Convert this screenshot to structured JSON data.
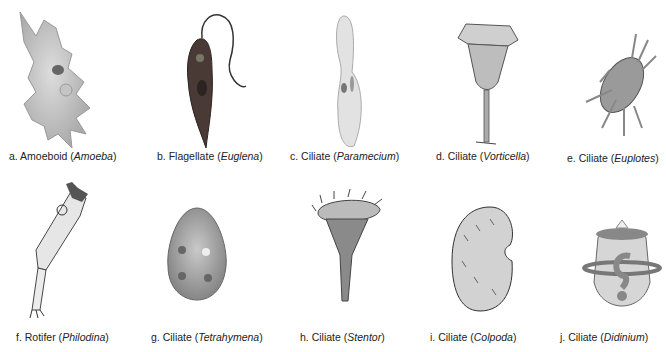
{
  "figure": {
    "panels": [
      {
        "letter": "a.",
        "type": "Amoeboid",
        "genus": "Amoeba",
        "icon": "amoeba-illustration"
      },
      {
        "letter": "b.",
        "type": "Flagellate",
        "genus": "Euglena",
        "icon": "euglena-illustration"
      },
      {
        "letter": "c.",
        "type": "Ciliate",
        "genus": "Paramecium",
        "icon": "paramecium-illustration"
      },
      {
        "letter": "d.",
        "type": "Ciliate",
        "genus": "Vorticella",
        "icon": "vorticella-illustration"
      },
      {
        "letter": "e.",
        "type": "Ciliate",
        "genus": "Euplotes",
        "icon": "euplotes-illustration"
      },
      {
        "letter": "f.",
        "type": "Rotifer",
        "genus": "Philodina",
        "icon": "philodina-illustration"
      },
      {
        "letter": "g.",
        "type": "Ciliate",
        "genus": "Tetrahymena",
        "icon": "tetrahymena-illustration"
      },
      {
        "letter": "h.",
        "type": "Ciliate",
        "genus": "Stentor",
        "icon": "stentor-illustration"
      },
      {
        "letter": "i.",
        "type": "Ciliate",
        "genus": "Colpoda",
        "icon": "colpoda-illustration"
      },
      {
        "letter": "j.",
        "type": "Ciliate",
        "genus": "Didinium",
        "icon": "didinium-illustration"
      }
    ]
  }
}
